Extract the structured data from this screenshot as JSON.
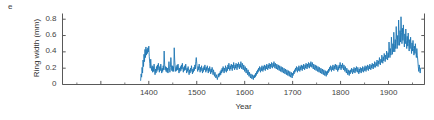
{
  "panel": {
    "label": "e"
  },
  "chart_data": {
    "type": "line",
    "title": "",
    "xlabel": "Year",
    "ylabel": "Ring width (mm)",
    "xlim": [
      1220,
      1975
    ],
    "ylim": [
      0,
      0.87
    ],
    "grid": false,
    "legend": null,
    "line_color": "#1f77b4",
    "line_width": 0.9,
    "axis_color": "#595959",
    "x_ticks": [
      1300,
      1400,
      1500,
      1600,
      1700,
      1800,
      1900
    ],
    "x_tick_labels": [
      "",
      "1400",
      "1500",
      "1600",
      "1700",
      "1800",
      "1900"
    ],
    "x_minor_ticks": [
      1250,
      1350,
      1450,
      1550,
      1650,
      1750,
      1850,
      1950
    ],
    "y_ticks": [
      0,
      0.2,
      0.4,
      0.6,
      0.8
    ],
    "y_tick_labels": [
      "0",
      "0.2",
      "0.4",
      "0.6",
      "0.8"
    ],
    "right_spine_ticks": [
      0,
      0.2,
      0.4,
      0.6,
      0.8
    ],
    "series_name": "Ring width",
    "data_start_year": 1383,
    "data_end_year": 1967,
    "x": [
      1383,
      1384,
      1385,
      1386,
      1387,
      1388,
      1389,
      1390,
      1391,
      1392,
      1393,
      1394,
      1395,
      1396,
      1397,
      1398,
      1399,
      1400,
      1401,
      1402,
      1403,
      1404,
      1405,
      1406,
      1407,
      1408,
      1409,
      1410,
      1411,
      1412,
      1413,
      1414,
      1415,
      1416,
      1417,
      1418,
      1419,
      1420,
      1421,
      1422,
      1423,
      1424,
      1425,
      1426,
      1427,
      1428,
      1429,
      1430,
      1431,
      1432,
      1433,
      1434,
      1435,
      1436,
      1437,
      1438,
      1439,
      1440,
      1441,
      1442,
      1443,
      1444,
      1445,
      1446,
      1447,
      1448,
      1449,
      1450,
      1451,
      1452,
      1453,
      1454,
      1455,
      1456,
      1457,
      1458,
      1459,
      1460,
      1461,
      1462,
      1463,
      1464,
      1465,
      1466,
      1467,
      1468,
      1469,
      1470,
      1471,
      1472,
      1473,
      1474,
      1475,
      1476,
      1477,
      1478,
      1479,
      1480,
      1481,
      1482,
      1483,
      1484,
      1485,
      1486,
      1487,
      1488,
      1489,
      1490,
      1491,
      1492,
      1493,
      1494,
      1495,
      1496,
      1497,
      1498,
      1499,
      1500,
      1501,
      1502,
      1503,
      1504,
      1505,
      1506,
      1507,
      1508,
      1509,
      1510,
      1511,
      1512,
      1513,
      1514,
      1515,
      1516,
      1517,
      1518,
      1519,
      1520,
      1521,
      1522,
      1523,
      1524,
      1525,
      1526,
      1527,
      1528,
      1529,
      1530,
      1531,
      1532,
      1533,
      1534,
      1535,
      1536,
      1537,
      1538,
      1539,
      1540,
      1541,
      1542,
      1543,
      1544,
      1545,
      1546,
      1547,
      1548,
      1549,
      1550,
      1551,
      1552,
      1553,
      1554,
      1555,
      1556,
      1557,
      1558,
      1559,
      1560,
      1561,
      1562,
      1563,
      1564,
      1565,
      1566,
      1567,
      1568,
      1569,
      1570,
      1571,
      1572,
      1573,
      1574,
      1575,
      1576,
      1577,
      1578,
      1579,
      1580,
      1581,
      1582,
      1583,
      1584,
      1585,
      1586,
      1587,
      1588,
      1589,
      1590,
      1591,
      1592,
      1593,
      1594,
      1595,
      1596,
      1597,
      1598,
      1599,
      1600,
      1601,
      1602,
      1603,
      1604,
      1605,
      1606,
      1607,
      1608,
      1609,
      1610,
      1611,
      1612,
      1613,
      1614,
      1615,
      1616,
      1617,
      1618,
      1619,
      1620,
      1621,
      1622,
      1623,
      1624,
      1625,
      1626,
      1627,
      1628,
      1629,
      1630,
      1631,
      1632,
      1633,
      1634,
      1635,
      1636,
      1637,
      1638,
      1639,
      1640,
      1641,
      1642,
      1643,
      1644,
      1645,
      1646,
      1647,
      1648,
      1649,
      1650,
      1651,
      1652,
      1653,
      1654,
      1655,
      1656,
      1657,
      1658,
      1659,
      1660,
      1661,
      1662,
      1663,
      1664,
      1665,
      1666,
      1667,
      1668,
      1669,
      1670,
      1671,
      1672,
      1673,
      1674,
      1675,
      1676,
      1677,
      1678,
      1679,
      1680,
      1681,
      1682,
      1683,
      1684,
      1685,
      1686,
      1687,
      1688,
      1689,
      1690,
      1691,
      1692,
      1693,
      1694,
      1695,
      1696,
      1697,
      1698,
      1699,
      1700,
      1701,
      1702,
      1703,
      1704,
      1705,
      1706,
      1707,
      1708,
      1709,
      1710,
      1711,
      1712,
      1713,
      1714,
      1715,
      1716,
      1717,
      1718,
      1719,
      1720,
      1721,
      1722,
      1723,
      1724,
      1725,
      1726,
      1727,
      1728,
      1729,
      1730,
      1731,
      1732,
      1733,
      1734,
      1735,
      1736,
      1737,
      1738,
      1739,
      1740,
      1741,
      1742,
      1743,
      1744,
      1745,
      1746,
      1747,
      1748,
      1749,
      1750,
      1751,
      1752,
      1753,
      1754,
      1755,
      1756,
      1757,
      1758,
      1759,
      1760,
      1761,
      1762,
      1763,
      1764,
      1765,
      1766,
      1767,
      1768,
      1769,
      1770,
      1771,
      1772,
      1773,
      1774,
      1775,
      1776,
      1777,
      1778,
      1779,
      1780,
      1781,
      1782,
      1783,
      1784,
      1785,
      1786,
      1787,
      1788,
      1789,
      1790,
      1791,
      1792,
      1793,
      1794,
      1795,
      1796,
      1797,
      1798,
      1799,
      1800,
      1801,
      1802,
      1803,
      1804,
      1805,
      1806,
      1807,
      1808,
      1809,
      1810,
      1811,
      1812,
      1813,
      1814,
      1815,
      1816,
      1817,
      1818,
      1819,
      1820,
      1821,
      1822,
      1823,
      1824,
      1825,
      1826,
      1827,
      1828,
      1829,
      1830,
      1831,
      1832,
      1833,
      1834,
      1835,
      1836,
      1837,
      1838,
      1839,
      1840,
      1841,
      1842,
      1843,
      1844,
      1845,
      1846,
      1847,
      1848,
      1849,
      1850,
      1851,
      1852,
      1853,
      1854,
      1855,
      1856,
      1857,
      1858,
      1859,
      1860,
      1861,
      1862,
      1863,
      1864,
      1865,
      1866,
      1867,
      1868,
      1869,
      1870,
      1871,
      1872,
      1873,
      1874,
      1875,
      1876,
      1877,
      1878,
      1879,
      1880,
      1881,
      1882,
      1883,
      1884,
      1885,
      1886,
      1887,
      1888,
      1889,
      1890,
      1891,
      1892,
      1893,
      1894,
      1895,
      1896,
      1897,
      1898,
      1899,
      1900,
      1901,
      1902,
      1903,
      1904,
      1905,
      1906,
      1907,
      1908,
      1909,
      1910,
      1911,
      1912,
      1913,
      1914,
      1915,
      1916,
      1917,
      1918,
      1919,
      1920,
      1921,
      1922,
      1923,
      1924,
      1925,
      1926,
      1927,
      1928,
      1929,
      1930,
      1931,
      1932,
      1933,
      1934,
      1935,
      1936,
      1937,
      1938,
      1939,
      1940,
      1941,
      1942,
      1943,
      1944,
      1945,
      1946,
      1947,
      1948,
      1949,
      1950,
      1951,
      1952,
      1953,
      1954,
      1955,
      1956,
      1957,
      1958,
      1959,
      1960,
      1961,
      1962,
      1963,
      1964,
      1965,
      1966,
      1967
    ],
    "y": [
      0.05,
      0.13,
      0.09,
      0.21,
      0.14,
      0.3,
      0.22,
      0.37,
      0.28,
      0.43,
      0.33,
      0.46,
      0.36,
      0.43,
      0.38,
      0.45,
      0.4,
      0.47,
      0.34,
      0.26,
      0.2,
      0.31,
      0.22,
      0.17,
      0.23,
      0.15,
      0.22,
      0.16,
      0.25,
      0.18,
      0.12,
      0.19,
      0.14,
      0.22,
      0.16,
      0.24,
      0.18,
      0.26,
      0.2,
      0.15,
      0.22,
      0.17,
      0.25,
      0.19,
      0.14,
      0.2,
      0.16,
      0.23,
      0.18,
      0.41,
      0.25,
      0.18,
      0.22,
      0.16,
      0.21,
      0.15,
      0.2,
      0.14,
      0.19,
      0.28,
      0.2,
      0.15,
      0.21,
      0.33,
      0.24,
      0.17,
      0.23,
      0.16,
      0.22,
      0.16,
      0.45,
      0.3,
      0.21,
      0.16,
      0.22,
      0.17,
      0.24,
      0.18,
      0.25,
      0.19,
      0.14,
      0.2,
      0.16,
      0.22,
      0.17,
      0.24,
      0.19,
      0.26,
      0.2,
      0.15,
      0.21,
      0.17,
      0.23,
      0.18,
      0.25,
      0.19,
      0.14,
      0.2,
      0.16,
      0.22,
      0.17,
      0.12,
      0.18,
      0.14,
      0.2,
      0.16,
      0.23,
      0.18,
      0.13,
      0.19,
      0.15,
      0.21,
      0.17,
      0.24,
      0.19,
      0.28,
      0.33,
      0.26,
      0.2,
      0.16,
      0.22,
      0.18,
      0.25,
      0.2,
      0.15,
      0.21,
      0.17,
      0.23,
      0.18,
      0.14,
      0.2,
      0.16,
      0.22,
      0.18,
      0.24,
      0.19,
      0.15,
      0.21,
      0.17,
      0.23,
      0.19,
      0.14,
      0.2,
      0.16,
      0.22,
      0.18,
      0.13,
      0.19,
      0.15,
      0.21,
      0.17,
      0.12,
      0.18,
      0.14,
      0.1,
      0.15,
      0.11,
      0.08,
      0.12,
      0.09,
      0.06,
      0.1,
      0.13,
      0.09,
      0.14,
      0.11,
      0.16,
      0.12,
      0.18,
      0.14,
      0.2,
      0.16,
      0.22,
      0.18,
      0.14,
      0.2,
      0.16,
      0.23,
      0.19,
      0.15,
      0.21,
      0.17,
      0.24,
      0.19,
      0.26,
      0.21,
      0.17,
      0.23,
      0.19,
      0.25,
      0.21,
      0.17,
      0.24,
      0.2,
      0.27,
      0.22,
      0.18,
      0.24,
      0.2,
      0.26,
      0.22,
      0.18,
      0.25,
      0.21,
      0.27,
      0.23,
      0.19,
      0.25,
      0.21,
      0.28,
      0.23,
      0.19,
      0.26,
      0.22,
      0.18,
      0.24,
      0.2,
      0.16,
      0.22,
      0.18,
      0.14,
      0.2,
      0.16,
      0.12,
      0.18,
      0.14,
      0.1,
      0.15,
      0.11,
      0.08,
      0.13,
      0.1,
      0.07,
      0.12,
      0.09,
      0.06,
      0.11,
      0.08,
      0.12,
      0.09,
      0.14,
      0.11,
      0.16,
      0.13,
      0.18,
      0.15,
      0.2,
      0.17,
      0.22,
      0.18,
      0.15,
      0.21,
      0.17,
      0.23,
      0.19,
      0.16,
      0.22,
      0.18,
      0.24,
      0.2,
      0.17,
      0.23,
      0.19,
      0.25,
      0.21,
      0.18,
      0.24,
      0.2,
      0.26,
      0.22,
      0.19,
      0.25,
      0.21,
      0.27,
      0.23,
      0.2,
      0.26,
      0.22,
      0.28,
      0.24,
      0.2,
      0.26,
      0.22,
      0.19,
      0.25,
      0.21,
      0.18,
      0.24,
      0.2,
      0.17,
      0.23,
      0.19,
      0.16,
      0.22,
      0.18,
      0.15,
      0.21,
      0.17,
      0.14,
      0.2,
      0.16,
      0.13,
      0.19,
      0.15,
      0.12,
      0.18,
      0.14,
      0.11,
      0.17,
      0.13,
      0.1,
      0.16,
      0.12,
      0.09,
      0.15,
      0.11,
      0.08,
      0.14,
      0.11,
      0.16,
      0.13,
      0.18,
      0.15,
      0.2,
      0.17,
      0.22,
      0.18,
      0.15,
      0.21,
      0.17,
      0.23,
      0.19,
      0.16,
      0.22,
      0.18,
      0.24,
      0.2,
      0.17,
      0.23,
      0.19,
      0.25,
      0.21,
      0.18,
      0.24,
      0.2,
      0.26,
      0.22,
      0.19,
      0.25,
      0.21,
      0.27,
      0.23,
      0.2,
      0.26,
      0.22,
      0.28,
      0.24,
      0.21,
      0.27,
      0.23,
      0.19,
      0.25,
      0.21,
      0.18,
      0.24,
      0.2,
      0.17,
      0.23,
      0.19,
      0.16,
      0.22,
      0.18,
      0.15,
      0.21,
      0.17,
      0.14,
      0.2,
      0.16,
      0.13,
      0.19,
      0.15,
      0.12,
      0.18,
      0.14,
      0.11,
      0.17,
      0.13,
      0.1,
      0.16,
      0.12,
      0.17,
      0.14,
      0.19,
      0.16,
      0.21,
      0.18,
      0.23,
      0.19,
      0.16,
      0.22,
      0.18,
      0.24,
      0.2,
      0.17,
      0.23,
      0.19,
      0.25,
      0.21,
      0.18,
      0.24,
      0.2,
      0.16,
      0.22,
      0.18,
      0.24,
      0.2,
      0.27,
      0.22,
      0.18,
      0.24,
      0.2,
      0.26,
      0.22,
      0.18,
      0.24,
      0.2,
      0.16,
      0.22,
      0.18,
      0.14,
      0.2,
      0.16,
      0.12,
      0.18,
      0.14,
      0.11,
      0.17,
      0.13,
      0.18,
      0.15,
      0.2,
      0.16,
      0.13,
      0.19,
      0.15,
      0.21,
      0.17,
      0.14,
      0.2,
      0.16,
      0.22,
      0.18,
      0.15,
      0.21,
      0.17,
      0.13,
      0.19,
      0.15,
      0.21,
      0.17,
      0.14,
      0.2,
      0.16,
      0.22,
      0.18,
      0.15,
      0.21,
      0.17,
      0.23,
      0.19,
      0.16,
      0.22,
      0.18,
      0.24,
      0.2,
      0.17,
      0.23,
      0.19,
      0.25,
      0.21,
      0.18,
      0.24,
      0.2,
      0.26,
      0.22,
      0.19,
      0.25,
      0.21,
      0.28,
      0.24,
      0.21,
      0.27,
      0.23,
      0.3,
      0.26,
      0.22,
      0.29,
      0.25,
      0.33,
      0.28,
      0.24,
      0.31,
      0.27,
      0.36,
      0.31,
      0.26,
      0.34,
      0.29,
      0.38,
      0.33,
      0.28,
      0.36,
      0.31,
      0.41,
      0.35,
      0.3,
      0.39,
      0.33,
      0.52,
      0.41,
      0.33,
      0.44,
      0.36,
      0.58,
      0.46,
      0.37,
      0.5,
      0.4,
      0.64,
      0.5,
      0.4,
      0.55,
      0.44,
      0.71,
      0.55,
      0.44,
      0.6,
      0.48,
      0.79,
      0.61,
      0.48,
      0.66,
      0.52,
      0.83,
      0.64,
      0.5,
      0.69,
      0.54,
      0.73,
      0.57,
      0.46,
      0.62,
      0.5,
      0.68,
      0.54,
      0.44,
      0.59,
      0.47,
      0.63,
      0.5,
      0.41,
      0.55,
      0.44,
      0.58,
      0.47,
      0.38,
      0.51,
      0.41,
      0.54,
      0.44,
      0.36,
      0.47,
      0.38,
      0.5,
      0.41,
      0.33,
      0.44,
      0.36,
      0.3,
      0.22,
      0.16,
      0.24,
      0.18,
      0.14,
      0.2
    ]
  }
}
